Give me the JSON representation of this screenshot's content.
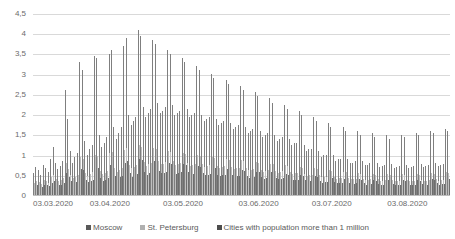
{
  "chart_data": {
    "type": "bar",
    "title": "",
    "xlabel": "",
    "ylabel": "",
    "ylim": [
      0,
      4.5
    ],
    "grid": true,
    "legend_position": "bottom",
    "decimal_separator": ",",
    "y_ticks": [
      "0",
      "0,5",
      "1",
      "1,5",
      "2",
      "2,5",
      "3",
      "3,5",
      "4",
      "4,5"
    ],
    "y_tick_values": [
      0,
      0.5,
      1,
      1.5,
      2,
      2.5,
      3,
      3.5,
      4,
      4.5
    ],
    "x_tick_labels": [
      "03.03.2020",
      "03.04.2020",
      "03.05.2020",
      "03.06.2020",
      "03.07.2020",
      "03.08.2020"
    ],
    "x_tick_positions": [
      0,
      31,
      61,
      92,
      122,
      153
    ],
    "categories_start": "03.03.2020",
    "categories_end": "20.08.2020",
    "n_points": 171,
    "colors": {
      "moscow": "#7f7f7f",
      "st_petersburg": "#bfbfbf",
      "million_cities": "#6e6e6e"
    },
    "series": [
      {
        "name": "Moscow",
        "values": [
          0.55,
          0.7,
          0.62,
          0.5,
          0.75,
          0.68,
          0.58,
          0.9,
          1.2,
          0.8,
          0.65,
          0.72,
          0.85,
          2.6,
          1.9,
          1.1,
          0.8,
          0.95,
          1.05,
          3.3,
          3.1,
          1.35,
          1.0,
          1.15,
          1.25,
          3.45,
          3.4,
          1.5,
          1.2,
          1.3,
          1.45,
          3.5,
          3.6,
          1.7,
          1.4,
          1.55,
          1.7,
          3.7,
          3.9,
          2.0,
          1.75,
          1.85,
          1.95,
          4.1,
          3.95,
          2.2,
          1.95,
          2.05,
          2.15,
          3.85,
          3.75,
          2.3,
          2.05,
          2.1,
          2.2,
          3.6,
          3.5,
          2.25,
          2.0,
          2.05,
          2.1,
          3.4,
          3.3,
          2.15,
          1.95,
          2.0,
          2.05,
          3.2,
          3.1,
          2.0,
          1.85,
          1.9,
          1.95,
          3.0,
          2.9,
          1.9,
          1.75,
          1.8,
          1.85,
          2.85,
          2.75,
          1.8,
          1.65,
          1.7,
          1.75,
          2.7,
          2.6,
          1.7,
          1.55,
          1.6,
          1.65,
          2.55,
          2.45,
          1.6,
          1.45,
          1.5,
          1.55,
          2.4,
          2.3,
          1.5,
          1.35,
          1.4,
          1.45,
          2.25,
          2.15,
          1.4,
          1.25,
          1.3,
          1.3,
          2.1,
          2.0,
          1.25,
          1.1,
          1.15,
          1.15,
          1.95,
          1.85,
          1.1,
          0.95,
          1.0,
          1.0,
          1.8,
          1.7,
          1.0,
          0.85,
          0.9,
          0.9,
          1.7,
          1.6,
          0.9,
          0.8,
          0.8,
          0.85,
          1.6,
          1.5,
          0.85,
          0.75,
          0.75,
          0.8,
          1.55,
          1.45,
          0.8,
          0.7,
          0.72,
          0.75,
          1.5,
          1.4,
          0.78,
          0.68,
          0.7,
          0.72,
          1.5,
          1.45,
          0.75,
          0.68,
          0.7,
          0.72,
          1.55,
          1.5,
          0.78,
          0.7,
          0.72,
          0.75,
          1.6,
          1.55,
          0.8,
          0.72,
          0.75,
          0.78,
          1.65,
          1.6,
          0.85
        ]
      },
      {
        "name": "St. Petersburg",
        "values": [
          0.3,
          0.35,
          0.32,
          0.28,
          0.38,
          0.34,
          0.3,
          0.45,
          0.5,
          0.4,
          0.35,
          0.38,
          0.42,
          0.8,
          0.65,
          0.5,
          0.42,
          0.46,
          0.5,
          0.95,
          0.9,
          0.55,
          0.48,
          0.52,
          0.56,
          1.0,
          0.98,
          0.6,
          0.52,
          0.55,
          0.6,
          1.05,
          1.08,
          0.68,
          0.58,
          0.62,
          0.68,
          1.12,
          1.18,
          0.75,
          0.66,
          0.7,
          0.74,
          1.25,
          1.2,
          0.82,
          0.72,
          0.76,
          0.8,
          1.18,
          1.15,
          0.85,
          0.76,
          0.78,
          0.82,
          1.1,
          1.08,
          0.84,
          0.75,
          0.77,
          0.79,
          1.05,
          1.02,
          0.8,
          0.73,
          0.75,
          0.77,
          1.0,
          0.97,
          0.76,
          0.7,
          0.72,
          0.74,
          0.95,
          0.92,
          0.72,
          0.67,
          0.69,
          0.71,
          0.9,
          0.88,
          0.69,
          0.64,
          0.66,
          0.68,
          0.86,
          0.84,
          0.66,
          0.61,
          0.63,
          0.65,
          0.82,
          0.8,
          0.63,
          0.58,
          0.6,
          0.62,
          0.78,
          0.76,
          0.6,
          0.55,
          0.57,
          0.59,
          0.74,
          0.72,
          0.57,
          0.52,
          0.54,
          0.54,
          0.7,
          0.68,
          0.53,
          0.48,
          0.5,
          0.5,
          0.66,
          0.64,
          0.49,
          0.44,
          0.46,
          0.46,
          0.62,
          0.6,
          0.46,
          0.41,
          0.43,
          0.43,
          0.58,
          0.56,
          0.43,
          0.39,
          0.39,
          0.41,
          0.55,
          0.53,
          0.41,
          0.37,
          0.37,
          0.39,
          0.53,
          0.51,
          0.39,
          0.35,
          0.36,
          0.37,
          0.52,
          0.5,
          0.38,
          0.34,
          0.35,
          0.36,
          0.52,
          0.5,
          0.37,
          0.34,
          0.35,
          0.36,
          0.53,
          0.51,
          0.38,
          0.35,
          0.36,
          0.37,
          0.54,
          0.53,
          0.39,
          0.36,
          0.37,
          0.38,
          0.56,
          0.55,
          0.41
        ]
      },
      {
        "name": "Cities with population more than 1 million",
        "values": [
          0.2,
          0.25,
          0.22,
          0.2,
          0.26,
          0.24,
          0.22,
          0.3,
          0.34,
          0.28,
          0.24,
          0.26,
          0.3,
          0.55,
          0.45,
          0.34,
          0.28,
          0.32,
          0.34,
          0.65,
          0.62,
          0.38,
          0.32,
          0.36,
          0.38,
          0.7,
          0.68,
          0.42,
          0.36,
          0.38,
          0.42,
          0.74,
          0.76,
          0.48,
          0.4,
          0.44,
          0.48,
          0.8,
          0.84,
          0.54,
          0.46,
          0.5,
          0.52,
          0.9,
          0.86,
          0.58,
          0.5,
          0.54,
          0.56,
          0.84,
          0.82,
          0.6,
          0.54,
          0.55,
          0.58,
          0.8,
          0.78,
          0.59,
          0.53,
          0.54,
          0.56,
          0.76,
          0.74,
          0.57,
          0.51,
          0.53,
          0.54,
          0.72,
          0.7,
          0.54,
          0.5,
          0.51,
          0.53,
          0.68,
          0.66,
          0.51,
          0.47,
          0.49,
          0.5,
          0.64,
          0.63,
          0.49,
          0.45,
          0.47,
          0.48,
          0.61,
          0.6,
          0.47,
          0.43,
          0.45,
          0.46,
          0.58,
          0.57,
          0.45,
          0.41,
          0.43,
          0.44,
          0.56,
          0.54,
          0.43,
          0.39,
          0.4,
          0.42,
          0.53,
          0.51,
          0.4,
          0.37,
          0.38,
          0.38,
          0.5,
          0.48,
          0.37,
          0.34,
          0.35,
          0.35,
          0.47,
          0.45,
          0.35,
          0.31,
          0.33,
          0.33,
          0.44,
          0.43,
          0.33,
          0.29,
          0.3,
          0.3,
          0.41,
          0.4,
          0.3,
          0.28,
          0.28,
          0.29,
          0.39,
          0.38,
          0.29,
          0.26,
          0.26,
          0.28,
          0.38,
          0.36,
          0.28,
          0.25,
          0.25,
          0.26,
          0.37,
          0.35,
          0.27,
          0.24,
          0.25,
          0.26,
          0.37,
          0.36,
          0.27,
          0.24,
          0.25,
          0.26,
          0.38,
          0.36,
          0.27,
          0.25,
          0.26,
          0.27,
          0.39,
          0.38,
          0.29,
          0.26,
          0.27,
          0.27,
          0.4,
          0.39,
          0.3
        ]
      }
    ]
  },
  "legend": {
    "items": [
      {
        "label": "Moscow"
      },
      {
        "label": "St. Petersburg"
      },
      {
        "label": "Cities with population more than 1 million"
      }
    ]
  }
}
